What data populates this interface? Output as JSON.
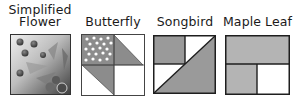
{
  "patterns": [
    {
      "name": "Simplified Flower",
      "line1": "Simplified",
      "line2": "Flower"
    },
    {
      "name": "Butterfly"
    },
    {
      "name": "Songbird"
    },
    {
      "name": "Maple Leaf"
    }
  ],
  "colors": {
    "block_gray": "#9a9a9a",
    "maple_gray": "#b4b4b4",
    "outline": "#1e1e1e",
    "dots": "#ffffff",
    "flower_dark": "#3a3a3a",
    "flower_light": "#e6e6e6"
  }
}
